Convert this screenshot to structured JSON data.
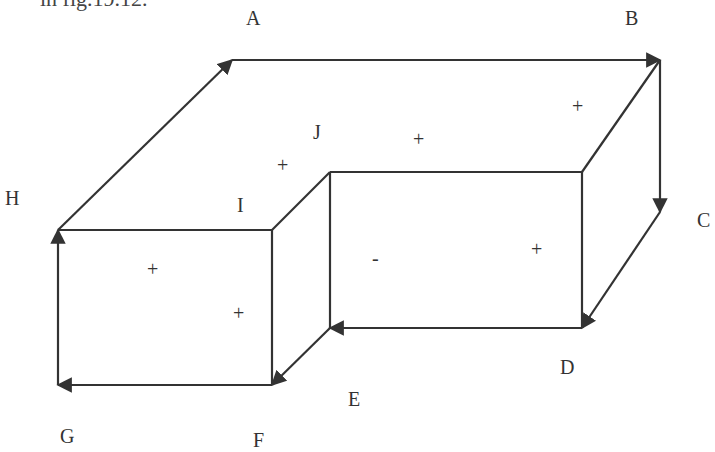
{
  "caption": "in fig.19.12.",
  "vertex_labels": {
    "A": "A",
    "B": "B",
    "C": "C",
    "D": "D",
    "E": "E",
    "F": "F",
    "G": "G",
    "H": "H",
    "I": "I",
    "J": "J"
  },
  "face_signs": {
    "top_left": "+",
    "top_middle": "+",
    "top_right": "+",
    "right_face": "+",
    "inner_face": "-",
    "left_front_1": "+",
    "left_front_2": "+"
  },
  "colors": {
    "line": "#333333",
    "background": "#ffffff"
  }
}
